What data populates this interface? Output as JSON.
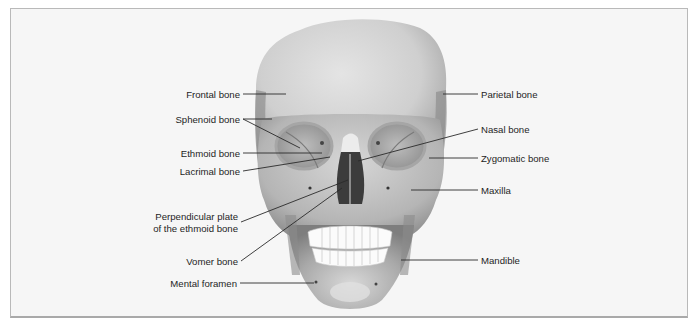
{
  "figure": {
    "colors": {
      "background": "#f6f6f6",
      "border": "#b9b9b9",
      "bone_light": "#e2e2e2",
      "bone_mid": "#bdbdbd",
      "bone_dark": "#8a8a8a",
      "leader_line": "#2a2a2a",
      "text": "#1e1e1e"
    }
  },
  "labels_left": [
    {
      "id": "frontal",
      "text": "Frontal bone"
    },
    {
      "id": "sphenoid",
      "text": "Sphenoid bone"
    },
    {
      "id": "ethmoid",
      "text": "Ethmoid bone"
    },
    {
      "id": "lacrimal",
      "text": "Lacrimal bone"
    },
    {
      "id": "perpendicular_1",
      "text": "Perpendicular plate"
    },
    {
      "id": "perpendicular_2",
      "text": "of the ethmoid bone"
    },
    {
      "id": "vomer",
      "text": "Vomer bone"
    },
    {
      "id": "mental",
      "text": "Mental foramen"
    }
  ],
  "labels_right": [
    {
      "id": "parietal",
      "text": "Parietal bone"
    },
    {
      "id": "nasal",
      "text": "Nasal bone"
    },
    {
      "id": "zygomatic",
      "text": "Zygomatic bone"
    },
    {
      "id": "maxilla",
      "text": "Maxilla"
    },
    {
      "id": "mandible",
      "text": "Mandible"
    }
  ]
}
